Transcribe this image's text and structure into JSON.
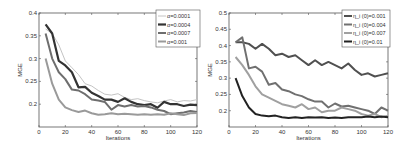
{
  "chart_data": [
    {
      "type": "line",
      "title": "",
      "xlabel": "Iterations",
      "ylabel": "MGE",
      "xlim": [
        0,
        120
      ],
      "ylim": [
        0.15,
        0.4
      ],
      "xticks": [
        0,
        20,
        40,
        60,
        80,
        100,
        120
      ],
      "yticks": [
        0.2,
        0.25,
        0.3,
        0.35,
        0.4
      ],
      "ytick_labels": [
        "0.2",
        "0.25",
        "0.3",
        "0.35",
        "0.4"
      ],
      "grid": false,
      "legend_position": "upper right",
      "x": [
        5,
        10,
        15,
        20,
        25,
        30,
        35,
        40,
        45,
        50,
        55,
        60,
        65,
        70,
        75,
        80,
        85,
        90,
        95,
        100,
        105,
        110,
        115,
        120
      ],
      "series": [
        {
          "name": "α=0.0001",
          "color": "#c4c4c4",
          "width": 1.0,
          "values": [
            0.365,
            0.355,
            0.33,
            0.295,
            0.28,
            0.265,
            0.245,
            0.24,
            0.23,
            0.222,
            0.22,
            0.223,
            0.215,
            0.21,
            0.212,
            0.208,
            0.205,
            0.203,
            0.207,
            0.21,
            0.205,
            0.208,
            0.207,
            0.21
          ]
        },
        {
          "name": "α=0.0004",
          "color": "#333333",
          "width": 2.2,
          "values": [
            0.375,
            0.355,
            0.295,
            0.285,
            0.27,
            0.237,
            0.238,
            0.225,
            0.218,
            0.21,
            0.21,
            0.205,
            0.213,
            0.205,
            0.2,
            0.198,
            0.2,
            0.192,
            0.205,
            0.2,
            0.2,
            0.196,
            0.199,
            0.198
          ]
        },
        {
          "name": "α=0.0007",
          "color": "#6e6e6e",
          "width": 2.0,
          "values": [
            0.355,
            0.3,
            0.27,
            0.255,
            0.232,
            0.23,
            0.222,
            0.21,
            0.208,
            0.205,
            0.188,
            0.198,
            0.195,
            0.198,
            0.195,
            0.196,
            0.193,
            0.188,
            0.185,
            0.178,
            0.18,
            0.182,
            0.185,
            0.183
          ]
        },
        {
          "name": "α=0.001",
          "color": "#9a9a9a",
          "width": 2.0,
          "values": [
            0.3,
            0.245,
            0.21,
            0.193,
            0.187,
            0.183,
            0.186,
            0.18,
            0.177,
            0.178,
            0.18,
            0.178,
            0.179,
            0.178,
            0.177,
            0.178,
            0.177,
            0.178,
            0.177,
            0.18,
            0.178,
            0.176,
            0.18,
            0.181
          ]
        }
      ]
    },
    {
      "type": "line",
      "title": "",
      "xlabel": "Iterations",
      "ylabel": "MGE",
      "xlim": [
        0,
        120
      ],
      "ylim": [
        0.15,
        0.5
      ],
      "xticks": [
        0,
        20,
        40,
        60,
        80,
        100,
        120
      ],
      "yticks": [
        0.2,
        0.25,
        0.3,
        0.35,
        0.4,
        0.45,
        0.5
      ],
      "ytick_labels": [
        "0.2",
        "0.25",
        "0.3",
        "0.35",
        "0.4",
        "0.45",
        "0.5"
      ],
      "grid": false,
      "legend_position": "upper right",
      "x": [
        5,
        10,
        15,
        20,
        25,
        30,
        35,
        40,
        45,
        50,
        55,
        60,
        65,
        70,
        75,
        80,
        85,
        90,
        95,
        100,
        105,
        110,
        115,
        120
      ],
      "series": [
        {
          "name": "η_i (0)=0.001",
          "color": "#505050",
          "width": 2.0,
          "values": [
            0.41,
            0.41,
            0.405,
            0.39,
            0.405,
            0.39,
            0.37,
            0.375,
            0.365,
            0.37,
            0.355,
            0.34,
            0.355,
            0.34,
            0.35,
            0.34,
            0.33,
            0.345,
            0.325,
            0.31,
            0.315,
            0.305,
            0.31,
            0.315
          ]
        },
        {
          "name": "η_i (0)=0.004",
          "color": "#707070",
          "width": 2.0,
          "values": [
            0.41,
            0.425,
            0.33,
            0.335,
            0.32,
            0.28,
            0.285,
            0.265,
            0.26,
            0.25,
            0.245,
            0.235,
            0.228,
            0.228,
            0.21,
            0.222,
            0.213,
            0.215,
            0.21,
            0.205,
            0.2,
            0.19,
            0.21,
            0.2
          ]
        },
        {
          "name": "η_i (0)=0.007",
          "color": "#a0a0a0",
          "width": 2.0,
          "values": [
            0.365,
            0.34,
            0.31,
            0.275,
            0.25,
            0.24,
            0.23,
            0.22,
            0.215,
            0.21,
            0.22,
            0.205,
            0.21,
            0.195,
            0.2,
            0.2,
            0.21,
            0.205,
            0.2,
            0.19,
            0.185,
            0.19,
            0.18,
            0.185
          ]
        },
        {
          "name": "η_i (0)=0.01",
          "color": "#222222",
          "width": 2.0,
          "values": [
            0.3,
            0.245,
            0.21,
            0.19,
            0.185,
            0.183,
            0.185,
            0.18,
            0.178,
            0.18,
            0.178,
            0.18,
            0.179,
            0.18,
            0.178,
            0.179,
            0.178,
            0.18,
            0.18,
            0.18,
            0.182,
            0.18,
            0.182,
            0.18
          ]
        }
      ]
    }
  ]
}
